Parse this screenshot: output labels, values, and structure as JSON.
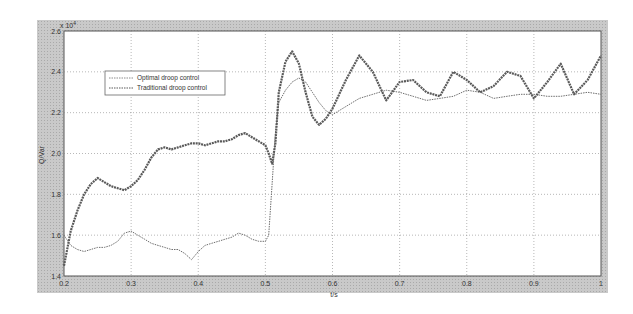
{
  "chart_data": {
    "type": "line",
    "title": "",
    "xlabel": "t/s",
    "ylabel": "Q/Var",
    "y_multiplier": "x10^4",
    "xlim": [
      0.2,
      1.0
    ],
    "ylim": [
      1.4,
      2.6
    ],
    "grid": true,
    "legend_position": "upper-left",
    "x_ticks": [
      "0.2",
      "0.3",
      "0.4",
      "0.5",
      "0.6",
      "0.7",
      "0.8",
      "0.9",
      "1"
    ],
    "y_ticks": [
      "1.4",
      "1.6",
      "1.8",
      "2.0",
      "2.2",
      "2.4",
      "2.6"
    ],
    "series": [
      {
        "name": "Optimal droop control",
        "style": "thin",
        "color": "#6e6e6e",
        "x": [
          0.2,
          0.21,
          0.22,
          0.23,
          0.24,
          0.25,
          0.26,
          0.27,
          0.28,
          0.29,
          0.3,
          0.31,
          0.32,
          0.33,
          0.34,
          0.35,
          0.36,
          0.37,
          0.38,
          0.39,
          0.4,
          0.41,
          0.42,
          0.43,
          0.44,
          0.45,
          0.46,
          0.47,
          0.48,
          0.49,
          0.5,
          0.505,
          0.51,
          0.515,
          0.52,
          0.53,
          0.54,
          0.55,
          0.56,
          0.57,
          0.58,
          0.59,
          0.6,
          0.62,
          0.64,
          0.66,
          0.68,
          0.7,
          0.72,
          0.74,
          0.76,
          0.78,
          0.8,
          0.82,
          0.84,
          0.86,
          0.88,
          0.9,
          0.92,
          0.94,
          0.96,
          0.98,
          1.0
        ],
        "values": [
          1.6,
          1.55,
          1.53,
          1.52,
          1.53,
          1.54,
          1.54,
          1.55,
          1.57,
          1.61,
          1.62,
          1.6,
          1.58,
          1.56,
          1.55,
          1.54,
          1.53,
          1.53,
          1.51,
          1.48,
          1.52,
          1.55,
          1.56,
          1.57,
          1.58,
          1.59,
          1.61,
          1.6,
          1.58,
          1.57,
          1.57,
          1.6,
          1.85,
          2.1,
          2.25,
          2.31,
          2.35,
          2.37,
          2.35,
          2.3,
          2.25,
          2.21,
          2.19,
          2.23,
          2.27,
          2.29,
          2.31,
          2.3,
          2.28,
          2.26,
          2.27,
          2.28,
          2.31,
          2.3,
          2.27,
          2.28,
          2.29,
          2.29,
          2.28,
          2.28,
          2.29,
          2.3,
          2.29
        ]
      },
      {
        "name": "Traditional droop control",
        "style": "thick",
        "color": "#5a5a5a",
        "x": [
          0.2,
          0.21,
          0.22,
          0.23,
          0.24,
          0.25,
          0.26,
          0.27,
          0.28,
          0.29,
          0.3,
          0.31,
          0.32,
          0.33,
          0.34,
          0.35,
          0.36,
          0.37,
          0.38,
          0.39,
          0.4,
          0.41,
          0.42,
          0.43,
          0.44,
          0.45,
          0.46,
          0.47,
          0.48,
          0.49,
          0.5,
          0.505,
          0.51,
          0.515,
          0.52,
          0.53,
          0.54,
          0.55,
          0.56,
          0.57,
          0.58,
          0.59,
          0.6,
          0.62,
          0.64,
          0.66,
          0.68,
          0.7,
          0.72,
          0.74,
          0.76,
          0.78,
          0.8,
          0.82,
          0.84,
          0.86,
          0.88,
          0.9,
          0.92,
          0.94,
          0.96,
          0.98,
          1.0
        ],
        "values": [
          1.45,
          1.62,
          1.72,
          1.8,
          1.85,
          1.88,
          1.86,
          1.84,
          1.83,
          1.82,
          1.84,
          1.87,
          1.92,
          1.98,
          2.02,
          2.03,
          2.02,
          2.03,
          2.04,
          2.05,
          2.05,
          2.04,
          2.05,
          2.06,
          2.06,
          2.07,
          2.09,
          2.1,
          2.08,
          2.06,
          2.04,
          2.0,
          1.95,
          2.05,
          2.3,
          2.45,
          2.5,
          2.44,
          2.3,
          2.18,
          2.14,
          2.17,
          2.22,
          2.36,
          2.48,
          2.4,
          2.26,
          2.35,
          2.36,
          2.3,
          2.28,
          2.4,
          2.36,
          2.3,
          2.33,
          2.4,
          2.38,
          2.27,
          2.35,
          2.44,
          2.29,
          2.36,
          2.48
        ]
      }
    ]
  },
  "axes": {
    "multiplier_label": "x 10",
    "multiplier_exp": "4",
    "ylabel": "Q/Var",
    "xlabel": "t/s"
  },
  "legend": {
    "items": [
      {
        "label": "Optimal droop control"
      },
      {
        "label": "Traditional droop control"
      }
    ]
  }
}
